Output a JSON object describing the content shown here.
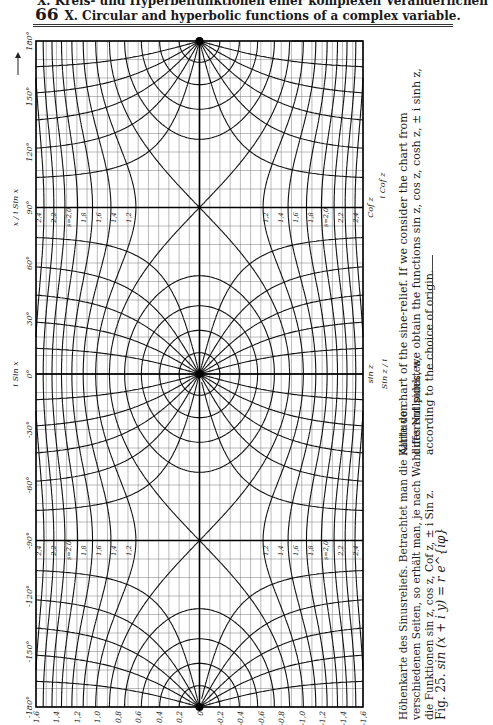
{
  "page": {
    "number": "66",
    "header_de": "X. Kreis- und Hyperbelfunktionen einer komplexen Veränderlichen",
    "header_en": "X. Circular and hyperbolic functions of a complex variable."
  },
  "figure": {
    "label": "Fig. 25.",
    "formula": "sin (x + i y) = r e^{iφ}",
    "caption_de": [
      "Höhenkarte des Sinusreliefs. Betrachtet man die Karte von",
      "verschiedenen Seiten, so erhält man, je nach Wahl des Nullpunktes,",
      "die Funktionen sin z, cos z, Cof z, ± i Sin z."
    ],
    "caption_en": [
      "Altitude chart of the sine-relief. If we consider the chart from",
      "different sides, we obtain the functions sin z, cos z, cosh z, ± i sinh z,",
      "according to the choice of origin."
    ],
    "side_labels": {
      "left_top_arrow": "x",
      "left_90": "x / i Sin x",
      "left_0": "i Sin x",
      "right_top": "Cof z",
      "right_top_alt": "i Cof z",
      "right_mid": "sin z",
      "right_mid_alt": "Sin z / i"
    }
  },
  "chart_data": {
    "type": "contour",
    "xlabel": "y (imaginary part)",
    "ylabel": "x (degrees)",
    "y_ticks": [
      "180°",
      "150°",
      "120°",
      "90°",
      "60°",
      "30°",
      "0°",
      "-30°",
      "-60°",
      "-90°",
      "-120°",
      "-150°",
      "-180°"
    ],
    "x_ticks": [
      "1,6",
      "1,4",
      "1,2",
      "1,0",
      "0,8",
      "0,6",
      "0,4",
      "0,2",
      "0",
      "-0,2",
      "-0,4",
      "-0,6",
      "-0,8",
      "-1,0",
      "-1,2",
      "-1,4",
      "-1,6"
    ],
    "modulus_contours_r": [
      0.2,
      0.4,
      0.6,
      0.8,
      1.0,
      1.2,
      1.4,
      1.6,
      1.8,
      2.0,
      2.2,
      2.4
    ],
    "phase_contours_deg": [
      -180,
      -150,
      -120,
      -90,
      -60,
      -30,
      0,
      30,
      60,
      90,
      120,
      150,
      180
    ],
    "zeros_at_x_deg": [
      180,
      0,
      -180
    ],
    "saddle_points_at_x_deg": [
      90,
      -90
    ],
    "row_labels_near_90": [
      "2,4",
      "2,2",
      "s=2,0",
      "1,8",
      "1,6",
      "1,4",
      "1,2"
    ],
    "annotations": [
      "φ = 10°",
      "s = 1,0",
      "90°",
      "-90°",
      "±180°",
      "-150°",
      "150°",
      "-30°",
      "30°",
      "60°",
      "-60°"
    ],
    "grid": true
  }
}
